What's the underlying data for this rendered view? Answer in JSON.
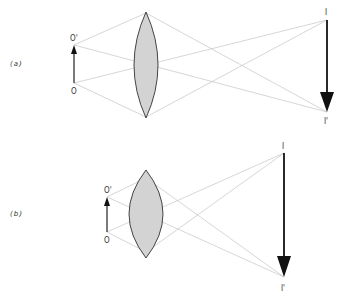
{
  "diagram": {
    "type": "thin converging lens image formation (two cases)",
    "panels": [
      {
        "id": "a",
        "label": "(a)",
        "object": {
          "base_label": "O",
          "tip_label": "O'"
        },
        "image": {
          "top_label": "I",
          "tip_label": "I'"
        },
        "lens": "biconvex"
      },
      {
        "id": "b",
        "label": "(b)",
        "object": {
          "base_label": "O",
          "tip_label": "O'"
        },
        "image": {
          "top_label": "I",
          "tip_label": "I'"
        },
        "lens": "biconvex (thicker)"
      }
    ]
  }
}
